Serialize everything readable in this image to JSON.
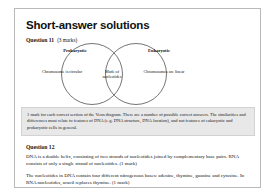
{
  "document": {
    "title": "Short-answer solutions"
  },
  "question11": {
    "heading": "Question 11",
    "marks": "(3 marks)",
    "venn": {
      "left_caption": "Prokaryotic",
      "right_caption": "Eukaryotic",
      "left_label": "Chromosome is circular",
      "overlap_label": "Made of nucleotides",
      "right_label": "Chromosomes are linear"
    },
    "marking_note": "1 mark for each correct section of the Venn diagram. There are a number of possible correct answers. The similarities and differences must relate to features of DNA (e.g. DNA structure, DNA location), and not features of eukaryotic and prokaryotic cells in general."
  },
  "question12": {
    "heading": "Question 12",
    "paragraph1": "DNA is a double helix, consisting of two strands of nucleotides joined by complementary base pairs. RNA consists of only a single strand of nucleotides. (1 mark)",
    "paragraph2": "The nucleotides in DNA contain four different nitrogenous bases: adenine, thymine, guanine and cytosine. In RNA nucleotides, uracil replaces thymine. (1 mark)"
  }
}
